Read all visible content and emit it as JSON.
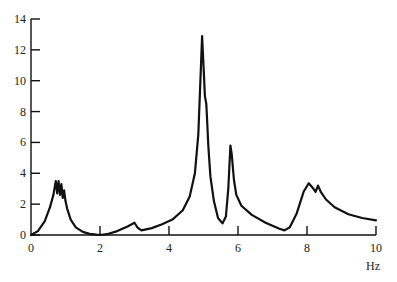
{
  "chart_data": {
    "type": "line",
    "title": "",
    "xlabel": "Hz",
    "ylabel": "",
    "xlim": [
      0,
      10
    ],
    "ylim": [
      0,
      14
    ],
    "grid": false,
    "legend": null,
    "x_ticks": [
      0,
      2,
      4,
      6,
      8,
      10
    ],
    "x_tick_labels": [
      "0",
      "2",
      "4",
      "6",
      "8",
      "10"
    ],
    "y_ticks": [
      0,
      2,
      4,
      6,
      8,
      10,
      12,
      14
    ],
    "y_tick_labels": [
      "0",
      "2",
      "4",
      "6",
      "8",
      "10",
      "12",
      "14"
    ],
    "series": [
      {
        "name": "spectrum",
        "color": "#111111",
        "x": [
          0.0,
          0.2,
          0.4,
          0.55,
          0.65,
          0.72,
          0.76,
          0.8,
          0.84,
          0.88,
          0.92,
          0.96,
          1.0,
          1.05,
          1.15,
          1.3,
          1.5,
          1.7,
          1.9,
          2.0,
          2.2,
          2.5,
          2.8,
          3.0,
          3.08,
          3.2,
          3.5,
          3.8,
          4.1,
          4.4,
          4.6,
          4.75,
          4.85,
          4.92,
          4.96,
          5.0,
          5.04,
          5.08,
          5.1,
          5.14,
          5.2,
          5.3,
          5.42,
          5.55,
          5.65,
          5.72,
          5.78,
          5.82,
          5.88,
          5.95,
          6.1,
          6.4,
          6.8,
          7.2,
          7.35,
          7.5,
          7.7,
          7.9,
          8.05,
          8.15,
          8.25,
          8.32,
          8.4,
          8.55,
          8.8,
          9.2,
          9.6,
          10.0
        ],
        "y": [
          0.0,
          0.25,
          0.9,
          1.8,
          2.6,
          3.5,
          2.7,
          3.5,
          2.6,
          3.3,
          2.4,
          2.9,
          2.2,
          1.7,
          1.0,
          0.5,
          0.2,
          0.07,
          0.02,
          0.0,
          0.05,
          0.25,
          0.55,
          0.8,
          0.5,
          0.3,
          0.45,
          0.7,
          1.0,
          1.6,
          2.5,
          4.0,
          6.5,
          10.5,
          12.9,
          11.0,
          9.0,
          8.5,
          7.6,
          5.8,
          3.8,
          2.2,
          1.1,
          0.75,
          1.2,
          3.0,
          5.8,
          5.2,
          3.6,
          2.6,
          1.9,
          1.3,
          0.8,
          0.4,
          0.3,
          0.5,
          1.4,
          2.8,
          3.35,
          3.1,
          2.8,
          3.2,
          2.8,
          2.3,
          1.8,
          1.35,
          1.1,
          0.95
        ]
      }
    ]
  }
}
